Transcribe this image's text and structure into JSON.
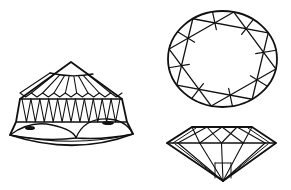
{
  "figure": {
    "width": 291,
    "height": 190,
    "background": "#ffffff",
    "ink": "#111111",
    "panels": [
      {
        "id": "cabochon-side-view",
        "label": "Domed gemstone, side view with inclusions"
      },
      {
        "id": "brilliant-top-view",
        "label": "Oval brilliant cut, top (table) view"
      },
      {
        "id": "brilliant-side-view",
        "label": "Brilliant cut, side profile"
      }
    ]
  },
  "dome": {
    "apex": [
      71,
      62
    ],
    "cap_left": [
      50,
      73
    ],
    "cap_right": [
      93,
      74
    ],
    "shoulder_left": [
      20,
      99
    ],
    "shoulder_right": [
      122,
      99
    ],
    "band_top_y": 99,
    "band_bottom_y": 122,
    "band_left_bottom": [
      16,
      122
    ],
    "band_right_bottom": [
      127,
      122
    ],
    "base_left": [
      10,
      135
    ],
    "base_right": [
      133,
      134
    ],
    "base_low": [
      75,
      148
    ],
    "crown_facets": 9,
    "pavilion_triangles": 11,
    "inclusions": [
      {
        "cx": 30,
        "cy": 128,
        "rx": 5,
        "ry": 2
      },
      {
        "cx": 108,
        "cy": 123,
        "rx": 6,
        "ry": 2
      }
    ]
  },
  "oval": {
    "cx": 222.5,
    "cy": 59,
    "rx": 54.5,
    "ry": 48,
    "star_rotation_deg": 12
  },
  "profile": {
    "left_tip": [
      167,
      143
    ],
    "right_tip": [
      276,
      143
    ],
    "table_left": [
      192,
      127
    ],
    "table_right": [
      252,
      127
    ],
    "culet": [
      223,
      181
    ],
    "girdle_y": 143
  }
}
